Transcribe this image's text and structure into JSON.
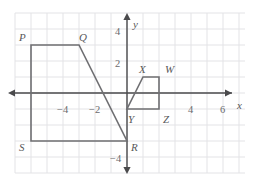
{
  "figure": {
    "type": "coordinate-plane-geometry",
    "background_color": "#ffffff",
    "grid_color": "#e3e3e6",
    "axis_color": "#4a4a4c",
    "shape_color": "#6f6f72",
    "label_color": "#58585a",
    "tick_label_color": "#6b6b6d",
    "origin_px": {
      "x": 127,
      "y": 93
    },
    "unit_px": 16,
    "grid_extent": {
      "x_min_px": 15,
      "x_max_px": 245,
      "y_min_px": 13,
      "y_max_px": 173
    },
    "axes": {
      "x_axis_name": "x",
      "y_axis_name": "y",
      "x_axis_name_pos": {
        "x": 237,
        "y": 100
      },
      "y_axis_name_pos": {
        "x": 133,
        "y": 19
      },
      "x_arrow_left_px": 8,
      "x_arrow_right_px": 232,
      "y_arrow_top_px": 13,
      "y_arrow_bottom_px": 174,
      "x_tick_labels": [
        {
          "text": "−4",
          "value": -4,
          "x": 57,
          "y": 105
        },
        {
          "text": "−2",
          "value": -2,
          "x": 89,
          "y": 105
        },
        {
          "text": "4",
          "value": 4,
          "x": 188,
          "y": 105
        },
        {
          "text": "6",
          "value": 6,
          "x": 220,
          "y": 105
        }
      ],
      "y_tick_labels": [
        {
          "text": "4",
          "value": 4,
          "x": 115,
          "y": 27
        },
        {
          "text": "2",
          "value": 2,
          "x": 115,
          "y": 59
        },
        {
          "text": "−4",
          "value": -4,
          "x": 110,
          "y": 154
        }
      ]
    },
    "shapes": [
      {
        "name": "PQRS",
        "kind": "trapezoid",
        "points": [
          {
            "label": "P",
            "x": -6,
            "y": 3
          },
          {
            "label": "Q",
            "x": -3,
            "y": 3
          },
          {
            "label": "R",
            "x": 0,
            "y": -3
          },
          {
            "label": "S",
            "x": -6,
            "y": -3
          }
        ],
        "vertex_labels": [
          {
            "label": "P",
            "x": 19,
            "y": 32
          },
          {
            "label": "Q",
            "x": 79,
            "y": 32
          },
          {
            "label": "R",
            "x": 131,
            "y": 142
          },
          {
            "label": "S",
            "x": 19,
            "y": 142
          }
        ]
      },
      {
        "name": "XYZW",
        "kind": "trapezoid",
        "points": [
          {
            "label": "X",
            "x": 1,
            "y": 1
          },
          {
            "label": "W",
            "x": 2,
            "y": 1
          },
          {
            "label": "Z",
            "x": 2,
            "y": -1
          },
          {
            "label": "Y",
            "x": 0,
            "y": -1
          }
        ],
        "vertex_labels": [
          {
            "label": "X",
            "x": 139,
            "y": 64
          },
          {
            "label": "W",
            "x": 165,
            "y": 64
          },
          {
            "label": "Z",
            "x": 163,
            "y": 114
          },
          {
            "label": "Y",
            "x": 128,
            "y": 114
          }
        ]
      }
    ]
  }
}
